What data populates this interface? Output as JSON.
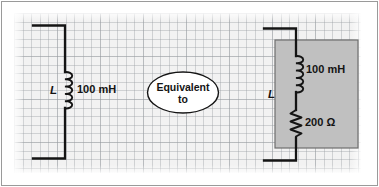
{
  "figure": {
    "background": "#f2f2f2",
    "grid_color": "#969ba0",
    "wire_color": "#141414",
    "shade_color": "#c0c0c0",
    "border_color": "#9a9a9a"
  },
  "left_circuit": {
    "name": "ideal-inductor-circuit",
    "inductor_symbol_label": "L",
    "inductor_value": "100 mH",
    "component_type": "inductor"
  },
  "equivalence": {
    "line1": "Equivalent",
    "line2": "to"
  },
  "right_circuit": {
    "name": "practical-inductor-model",
    "inductor_symbol_label": "L",
    "inductor_value": "100 mH",
    "resistor_value": "200 Ω",
    "shaded_region": "series model block"
  }
}
